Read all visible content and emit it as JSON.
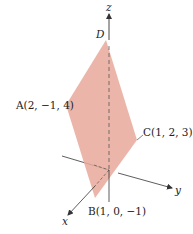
{
  "figure": {
    "colors": {
      "plane_fill": "#e8a99a",
      "plane_fill_opacity": 0.85,
      "axis": "#333333",
      "background": "#ffffff"
    },
    "axes": {
      "x_label": "x",
      "y_label": "y",
      "z_label": "z"
    },
    "points": {
      "A": {
        "label": "A(2, −1, 4)"
      },
      "B": {
        "label": "B(1, 0, −1)"
      },
      "C": {
        "label": "C(1, 2, 3)"
      },
      "D": {
        "label": "D"
      }
    }
  }
}
